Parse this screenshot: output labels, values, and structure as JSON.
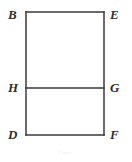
{
  "figure": {
    "kind": "plane-geometry-diagram",
    "background_color": "#ffffff",
    "stroke_color": "#3a3a3a",
    "stroke_width": 1.5,
    "caption_artifact": "Figure",
    "rectangle": {
      "left": 26,
      "right": 104,
      "top": 12,
      "bottom": 135,
      "divider_y": 88
    },
    "vertices": [
      {
        "id": "B",
        "label": "B",
        "position": "top-left",
        "x": 26,
        "y": 12
      },
      {
        "id": "E",
        "label": "E",
        "position": "top-right",
        "x": 104,
        "y": 12
      },
      {
        "id": "H",
        "label": "H",
        "position": "middle-left",
        "x": 26,
        "y": 88
      },
      {
        "id": "G",
        "label": "G",
        "position": "middle-right",
        "x": 104,
        "y": 88
      },
      {
        "id": "D",
        "label": "D",
        "position": "bottom-left",
        "x": 26,
        "y": 135
      },
      {
        "id": "F",
        "label": "F",
        "position": "bottom-right",
        "x": 104,
        "y": 135
      }
    ],
    "segments": [
      {
        "name": "BE",
        "from": "B",
        "to": "E",
        "orientation": "horizontal"
      },
      {
        "name": "EF",
        "from": "E",
        "to": "F",
        "orientation": "vertical"
      },
      {
        "name": "FD",
        "from": "F",
        "to": "D",
        "orientation": "horizontal"
      },
      {
        "name": "DB",
        "from": "D",
        "to": "B",
        "orientation": "vertical"
      },
      {
        "name": "HG",
        "from": "H",
        "to": "G",
        "orientation": "horizontal"
      }
    ]
  }
}
